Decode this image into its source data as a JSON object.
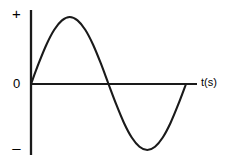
{
  "figure": {
    "background_color": "#ffffff",
    "stroke_color": "#1a1a1a",
    "text_color": "#000000",
    "labels": {
      "positive": "+",
      "zero": "0",
      "negative": "–",
      "time_axis": "t(s)"
    }
  },
  "chart_data": {
    "type": "line",
    "title": "",
    "xlabel": "t(s)",
    "ylabel": "",
    "grid": false,
    "legend": null,
    "axes": {
      "x_axis": {
        "label": "t(s)",
        "tick_labels": [],
        "range_note": "one full period, unscaled"
      },
      "y_axis": {
        "label": "",
        "tick_labels": [
          "+",
          "0",
          "–"
        ],
        "range_note": "amplitude marked only as + / 0 / –"
      }
    },
    "series": [
      {
        "name": "sine wave",
        "waveform": "sine",
        "amplitude": 1,
        "periods": 1,
        "phase": 0,
        "x": [
          0.0,
          0.05,
          0.1,
          0.15,
          0.2,
          0.25,
          0.3,
          0.35,
          0.4,
          0.45,
          0.5,
          0.55,
          0.6,
          0.65,
          0.7,
          0.75,
          0.8,
          0.85,
          0.9,
          0.95,
          1.0
        ],
        "values": [
          0.0,
          0.31,
          0.59,
          0.81,
          0.95,
          1.0,
          0.95,
          0.81,
          0.59,
          0.31,
          0.0,
          -0.31,
          -0.59,
          -0.81,
          -0.95,
          -1.0,
          -0.95,
          -0.81,
          -0.59,
          -0.31,
          0.0
        ]
      }
    ],
    "key_points": {
      "start": [
        0.0,
        0.0
      ],
      "peak": [
        0.25,
        1.0
      ],
      "zero_crossing": [
        0.5,
        0.0
      ],
      "trough": [
        0.75,
        -1.0
      ],
      "end": [
        1.0,
        0.0
      ]
    }
  },
  "geometry": {
    "y_axis": {
      "x": 31,
      "y_top": 10,
      "y_bottom": 155
    },
    "x_axis": {
      "y": 84,
      "x_left": 31,
      "x_right": 197
    },
    "curve": {
      "origin_x": 31,
      "zero_y": 84,
      "end_x": 186,
      "peak_y": 17,
      "trough_y": 150,
      "stroke_width": 2.1
    }
  }
}
